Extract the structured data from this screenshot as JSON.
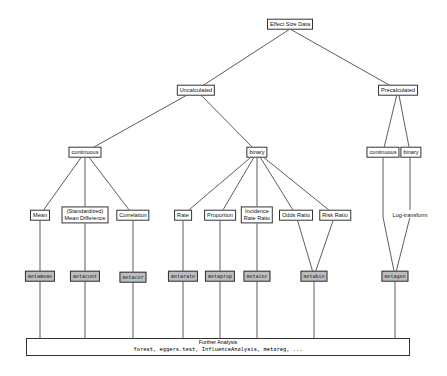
{
  "diagram": {
    "root": "Effect Size Data",
    "level1": {
      "uncalculated": "Uncalculated",
      "precalculated": "Precalculated"
    },
    "level2": {
      "continuous": "continuous",
      "binary": "binary",
      "pre_continuous": "continuous",
      "pre_binary": "binary"
    },
    "measures": {
      "mean": "Mean",
      "smd_line1": "(Standardized)",
      "smd_line2": "Mean Difference",
      "correlation": "Correlation",
      "rate": "Rate",
      "proportion": "Proportion",
      "irr_line1": "Incidence",
      "irr_line2": "Rate Ratio",
      "odds_ratio": "Odds Ratio",
      "risk_ratio": "Risk Ratio",
      "log_transform": "Log-transform"
    },
    "functions": {
      "metamean": "metamean",
      "metacont": "metacont",
      "metacor": "metacor",
      "metarate": "metarate",
      "metaprop": "metaprop",
      "metainc": "metainc",
      "metabin": "metabin",
      "metagen": "metagen"
    },
    "further": {
      "title": "Further Analysis",
      "functions": "forest, eggers.test, InfluenceAnalysis, metareg, ..."
    }
  }
}
